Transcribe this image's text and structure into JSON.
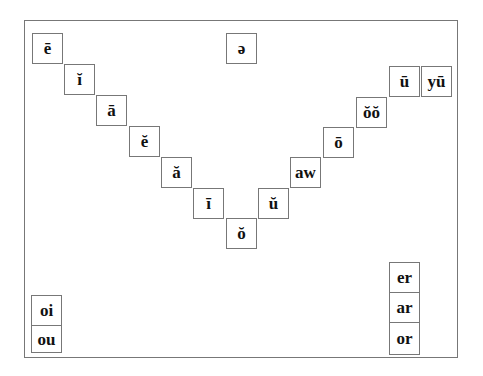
{
  "diagram": {
    "title": "",
    "vowel_chart": [
      {
        "label": "ē",
        "x": 32,
        "y": 33
      },
      {
        "label": "ĭ",
        "x": 64,
        "y": 64
      },
      {
        "label": "ā",
        "x": 96,
        "y": 95
      },
      {
        "label": "ĕ",
        "x": 129,
        "y": 126
      },
      {
        "label": "ă",
        "x": 161,
        "y": 157
      },
      {
        "label": "ī",
        "x": 193,
        "y": 188
      },
      {
        "label": "ŏ",
        "x": 226,
        "y": 218
      },
      {
        "label": "ŭ",
        "x": 258,
        "y": 188
      },
      {
        "label": "aw",
        "x": 290,
        "y": 157
      },
      {
        "label": "ō",
        "x": 323,
        "y": 127
      },
      {
        "label": "ŏŏ",
        "x": 356,
        "y": 97
      },
      {
        "label": "ū",
        "x": 389,
        "y": 66
      },
      {
        "label": "yū",
        "x": 421,
        "y": 66
      }
    ],
    "schwa": {
      "label": "ə",
      "x": 226,
      "y": 33
    },
    "diphthongs": [
      {
        "label": "oi",
        "x": 31,
        "y": 295
      },
      {
        "label": "ou",
        "x": 31,
        "y": 325
      }
    ],
    "r_controlled": [
      {
        "label": "er",
        "x": 389,
        "y": 262
      },
      {
        "label": "ar",
        "x": 389,
        "y": 292
      },
      {
        "label": "or",
        "x": 389,
        "y": 322
      }
    ]
  }
}
